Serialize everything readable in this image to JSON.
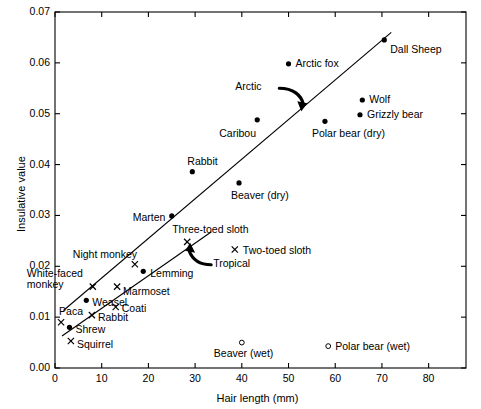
{
  "chart_data": {
    "type": "scatter",
    "title": "",
    "xlabel": "Hair length (mm)",
    "ylabel": "Insulative value",
    "xlim": [
      0,
      88
    ],
    "ylim": [
      0.0,
      0.07
    ],
    "xticks": [
      "0",
      "10",
      "20",
      "30",
      "40",
      "50",
      "60",
      "70",
      "80"
    ],
    "xtick_values": [
      0,
      10,
      20,
      30,
      40,
      50,
      60,
      70,
      80
    ],
    "yticks": [
      "0.00",
      "0.01",
      "0.02",
      "0.03",
      "0.04",
      "0.05",
      "0.06",
      "0.07"
    ],
    "ytick_values": [
      0.0,
      0.01,
      0.02,
      0.03,
      0.04,
      0.05,
      0.06,
      0.07
    ],
    "grid": false,
    "legend": "none",
    "marker_types": {
      "filled-circle": "Arctic / temperate species (dry)",
      "cross": "Tropical species",
      "open-circle": "Wet fur measurement"
    },
    "series": [
      {
        "name": "Arctic and temperate (dry fur)",
        "marker": "filled-circle",
        "points": [
          {
            "label": "Dall Sheep",
            "x": 70.5,
            "y": 0.0645,
            "label_dx": 6,
            "label_dy": 10
          },
          {
            "label": "Arctic fox",
            "x": 50.0,
            "y": 0.0598,
            "label_dx": 7,
            "label_dy": 0
          },
          {
            "label": "Wolf",
            "x": 65.8,
            "y": 0.0527,
            "label_dx": 7,
            "label_dy": 0
          },
          {
            "label": "Grizzly bear",
            "x": 65.3,
            "y": 0.0498,
            "label_dx": 7,
            "label_dy": 0
          },
          {
            "label": "Polar bear (dry)",
            "x": 57.8,
            "y": 0.0485,
            "label_dx": -13,
            "label_dy": 13
          },
          {
            "label": "Caribou",
            "x": 43.3,
            "y": 0.0488,
            "label_dx": -38,
            "label_dy": 14
          },
          {
            "label": "Rabbit",
            "x": 29.4,
            "y": 0.0386,
            "label_dx": -5,
            "label_dy": -10
          },
          {
            "label": "Beaver (dry)",
            "x": 39.4,
            "y": 0.0364,
            "label_dx": -8,
            "label_dy": 13
          },
          {
            "label": "Marten",
            "x": 25.0,
            "y": 0.0299,
            "label_dx": -39,
            "label_dy": 2
          },
          {
            "label": "Lemming",
            "x": 18.9,
            "y": 0.019,
            "label_dx": 7,
            "label_dy": 3
          },
          {
            "label": "Weasel",
            "x": 6.7,
            "y": 0.0133,
            "label_dx": 6,
            "label_dy": 3
          },
          {
            "label": "Shrew",
            "x": 3.1,
            "y": 0.008,
            "label_dx": 6,
            "label_dy": 3
          }
        ]
      },
      {
        "name": "Tropical",
        "marker": "cross",
        "points": [
          {
            "label": "Three-toed sloth",
            "x": 28.3,
            "y": 0.0248,
            "label_dx": -15,
            "label_dy": -12
          },
          {
            "label": "Two-toed sloth",
            "x": 38.5,
            "y": 0.0233,
            "label_dx": 8,
            "label_dy": 1
          },
          {
            "label": "Night monkey",
            "x": 17.1,
            "y": 0.0204,
            "label_dx": -62,
            "label_dy": -9
          },
          {
            "label": "Marmoset",
            "x": 13.3,
            "y": 0.016,
            "label_dx": 6,
            "label_dy": 5
          },
          {
            "label": "White-faced monkey",
            "x": 8.1,
            "y": 0.016,
            "label_dx": -66,
            "label_dy": -13
          },
          {
            "label": "Coati",
            "x": 13.0,
            "y": 0.012,
            "label_dx": 6,
            "label_dy": 2
          },
          {
            "label": "Rabbit",
            "x": 7.9,
            "y": 0.0104,
            "label_dx": 6,
            "label_dy": 3
          },
          {
            "label": "Paca",
            "x": 1.3,
            "y": 0.009,
            "label_dx": -2,
            "label_dy": -10
          },
          {
            "label": "Squirrel",
            "x": 3.4,
            "y": 0.0053,
            "label_dx": 6,
            "label_dy": 4
          }
        ]
      },
      {
        "name": "Wet fur",
        "marker": "open-circle",
        "points": [
          {
            "label": "Beaver (wet)",
            "x": 40.0,
            "y": 0.005,
            "label_dx": -28,
            "label_dy": 11
          },
          {
            "label": "Polar bear (wet)",
            "x": 58.5,
            "y": 0.0043,
            "label_dx": 7,
            "label_dy": 1
          }
        ]
      }
    ],
    "trendlines": [
      {
        "name": "arctic-trendline",
        "x0": 1.8,
        "y0": 0.0113,
        "x1": 72.0,
        "y1": 0.066
      },
      {
        "name": "tropical-trendline",
        "x0": 1.5,
        "y0": 0.0063,
        "x1": 33.5,
        "y1": 0.0268
      }
    ],
    "annotations": [
      {
        "label": "Arctic",
        "x": 44.6,
        "y": 0.0552,
        "arrow": "curved-down-right"
      },
      {
        "label": "Tropical",
        "x": 33.0,
        "y": 0.0205,
        "arrow": "curved-up-left"
      }
    ]
  }
}
